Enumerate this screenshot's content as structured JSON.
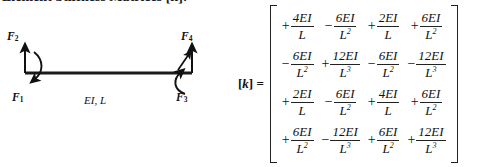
{
  "heading": {
    "text": "Element Stiffness Matrices [k]:"
  },
  "figure": {
    "name": "beam-element-free-body-diagram",
    "member_label": "EI, L",
    "forces": [
      {
        "id": "F1",
        "label": "F",
        "subscript": "1",
        "type": "moment",
        "position": "left-bottom"
      },
      {
        "id": "F2",
        "label": "F",
        "subscript": "2",
        "type": "shear",
        "position": "left-top"
      },
      {
        "id": "F3",
        "label": "F",
        "subscript": "3",
        "type": "moment",
        "position": "right-bottom"
      },
      {
        "id": "F4",
        "label": "F",
        "subscript": "4",
        "type": "shear",
        "position": "right-top"
      }
    ],
    "colors": {
      "beam": "#1a1a1a",
      "arrow": "#111111"
    }
  },
  "equation": {
    "label_prefix": "[",
    "label_symbol": "k",
    "label_suffix": "] =",
    "matrix": {
      "rows": 4,
      "cols": 4,
      "cells": [
        [
          {
            "sign": "+",
            "numerator": "4EI",
            "denominator": "L",
            "power": ""
          },
          {
            "sign": "−",
            "numerator": "6EI",
            "denominator": "L",
            "power": "2"
          },
          {
            "sign": "+",
            "numerator": "2EI",
            "denominator": "L",
            "power": ""
          },
          {
            "sign": "+",
            "numerator": "6EI",
            "denominator": "L",
            "power": "2"
          }
        ],
        [
          {
            "sign": "−",
            "numerator": "6EI",
            "denominator": "L",
            "power": "2"
          },
          {
            "sign": "+",
            "numerator": "12EI",
            "denominator": "L",
            "power": "3"
          },
          {
            "sign": "−",
            "numerator": "6EI",
            "denominator": "L",
            "power": "2"
          },
          {
            "sign": "−",
            "numerator": "12EI",
            "denominator": "L",
            "power": "3"
          }
        ],
        [
          {
            "sign": "+",
            "numerator": "2EI",
            "denominator": "L",
            "power": ""
          },
          {
            "sign": "−",
            "numerator": "6EI",
            "denominator": "L",
            "power": "2"
          },
          {
            "sign": "+",
            "numerator": "4EI",
            "denominator": "L",
            "power": ""
          },
          {
            "sign": "+",
            "numerator": "6EI",
            "denominator": "L",
            "power": "2"
          }
        ],
        [
          {
            "sign": "+",
            "numerator": "6EI",
            "denominator": "L",
            "power": "2"
          },
          {
            "sign": "−",
            "numerator": "12EI",
            "denominator": "L",
            "power": "3"
          },
          {
            "sign": "+",
            "numerator": "6EI",
            "denominator": "L",
            "power": "2"
          },
          {
            "sign": "+",
            "numerator": "12EI",
            "denominator": "L",
            "power": "3"
          }
        ]
      ]
    }
  }
}
